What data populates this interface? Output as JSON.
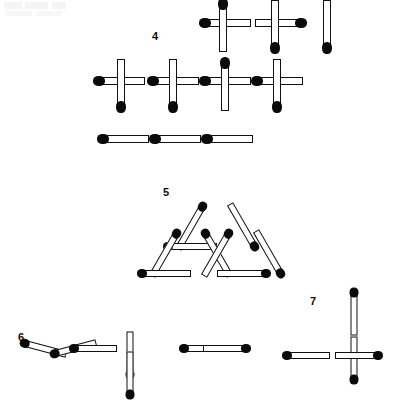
{
  "page": {
    "background_color": "#ffffff",
    "stick_color": "#ffffff",
    "stick_outline_color": "#111111",
    "match_head_color": "#0b0b0b"
  },
  "figures": [
    {
      "id": "figure-4",
      "label": "4",
      "label_x": 152,
      "label_y": 31,
      "description": "Staircase of four squares made of matchsticks",
      "match_count": 16,
      "matches": [
        {
          "x": 201,
          "y": 19,
          "len": 50,
          "w": 8,
          "angle": 0,
          "head": "start"
        },
        {
          "x": 255,
          "y": 19,
          "len": 50,
          "w": 8,
          "angle": 0,
          "head": "end"
        },
        {
          "x": 197,
          "y": 22,
          "len": 52,
          "w": 8,
          "angle": 90,
          "head": "start"
        },
        {
          "x": 249,
          "y": 22,
          "len": 52,
          "w": 8,
          "angle": 90,
          "head": "end"
        },
        {
          "x": 301,
          "y": 22,
          "len": 52,
          "w": 8,
          "angle": 90,
          "head": "end"
        },
        {
          "x": 95,
          "y": 77,
          "len": 50,
          "w": 8,
          "angle": 0,
          "head": "start"
        },
        {
          "x": 149,
          "y": 77,
          "len": 50,
          "w": 8,
          "angle": 0,
          "head": "start"
        },
        {
          "x": 201,
          "y": 77,
          "len": 50,
          "w": 8,
          "angle": 0,
          "head": "start"
        },
        {
          "x": 253,
          "y": 77,
          "len": 50,
          "w": 8,
          "angle": 0,
          "head": "start"
        },
        {
          "x": 95,
          "y": 81,
          "len": 52,
          "w": 8,
          "angle": 90,
          "head": "end"
        },
        {
          "x": 147,
          "y": 81,
          "len": 52,
          "w": 8,
          "angle": 90,
          "head": "end"
        },
        {
          "x": 199,
          "y": 81,
          "len": 52,
          "w": 8,
          "angle": 90,
          "head": "start"
        },
        {
          "x": 251,
          "y": 81,
          "len": 52,
          "w": 8,
          "angle": 90,
          "head": "end"
        },
        {
          "x": 99,
          "y": 135,
          "len": 50,
          "w": 8,
          "angle": 0,
          "head": "start"
        },
        {
          "x": 151,
          "y": 135,
          "len": 50,
          "w": 8,
          "angle": 0,
          "head": "start"
        },
        {
          "x": 203,
          "y": 135,
          "len": 50,
          "w": 8,
          "angle": 0,
          "head": "start"
        }
      ]
    },
    {
      "id": "figure-5",
      "label": "5",
      "label_x": 163,
      "label_y": 187,
      "description": "Large triangle subdivided into four smaller triangles",
      "match_count": 9,
      "matches": [
        {
          "x": 165,
          "y": 223,
          "len": 52,
          "w": 7,
          "angle": -60,
          "head": "end"
        },
        {
          "x": 217,
          "y": 223,
          "len": 52,
          "w": 7,
          "angle": 60,
          "head": "end"
        },
        {
          "x": 165,
          "y": 243,
          "len": 52,
          "w": 7,
          "angle": 0,
          "head": "start"
        },
        {
          "x": 139,
          "y": 250,
          "len": 52,
          "w": 7,
          "angle": -60,
          "head": "end"
        },
        {
          "x": 191,
          "y": 250,
          "len": 52,
          "w": 7,
          "angle": 60,
          "head": "start"
        },
        {
          "x": 191,
          "y": 250,
          "len": 52,
          "w": 7,
          "angle": -60,
          "head": "end"
        },
        {
          "x": 243,
          "y": 250,
          "len": 52,
          "w": 7,
          "angle": 60,
          "head": "end"
        },
        {
          "x": 139,
          "y": 270,
          "len": 52,
          "w": 7,
          "angle": 0,
          "head": "start"
        },
        {
          "x": 217,
          "y": 270,
          "len": 52,
          "w": 7,
          "angle": 0,
          "head": "end"
        }
      ]
    },
    {
      "id": "figure-6",
      "label": "6",
      "label_x": 18,
      "label_y": 332,
      "description": "Roman numeral equation VI = II formed with matchsticks",
      "expression": "VI = II",
      "match_count": 7,
      "matches": [
        {
          "x": 21,
          "y": 345,
          "len": 46,
          "w": 7,
          "angle": 15,
          "head": "start"
        },
        {
          "x": 51,
          "y": 345,
          "len": 46,
          "w": 7,
          "angle": -15,
          "head": "start"
        },
        {
          "x": 71,
          "y": 345,
          "len": 46,
          "w": 7,
          "angle": 0,
          "head": "start"
        },
        {
          "x": 107,
          "y": 351,
          "len": 46,
          "w": 7,
          "angle": 90,
          "head": "end"
        },
        {
          "x": 107,
          "y": 371,
          "len": 46,
          "w": 7,
          "angle": 90,
          "head": "end"
        },
        {
          "x": 181,
          "y": 345,
          "len": 46,
          "w": 7,
          "angle": 0,
          "head": "start"
        },
        {
          "x": 203,
          "y": 345,
          "len": 46,
          "w": 7,
          "angle": 0,
          "head": "end"
        }
      ]
    },
    {
      "id": "figure-7",
      "label": "7",
      "label_x": 310,
      "label_y": 296,
      "description": "Plus sign cross made of four matchsticks, heads outward",
      "match_count": 4,
      "matches": [
        {
          "x": 331,
          "y": 309,
          "len": 46,
          "w": 7,
          "angle": 90,
          "head": "start"
        },
        {
          "x": 331,
          "y": 356,
          "len": 46,
          "w": 7,
          "angle": 90,
          "head": "end"
        },
        {
          "x": 284,
          "y": 352,
          "len": 46,
          "w": 7,
          "angle": 0,
          "head": "start"
        },
        {
          "x": 335,
          "y": 352,
          "len": 46,
          "w": 7,
          "angle": 0,
          "head": "end"
        }
      ]
    }
  ]
}
